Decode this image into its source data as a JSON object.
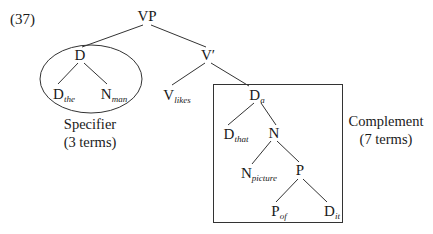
{
  "example_number": "(37)",
  "nodes": {
    "vp": {
      "label": "VP",
      "sub": ""
    },
    "d_spec": {
      "label": "D",
      "sub": ""
    },
    "d_the": {
      "label": "D",
      "sub": "the"
    },
    "n_man": {
      "label": "N",
      "sub": "man"
    },
    "v_bar": {
      "label": "V′",
      "sub": ""
    },
    "v_likes": {
      "label": "V",
      "sub": "likes"
    },
    "d_a": {
      "label": "D",
      "sub": "a"
    },
    "d_that": {
      "label": "D",
      "sub": "that"
    },
    "n": {
      "label": "N",
      "sub": ""
    },
    "n_picture": {
      "label": "N",
      "sub": "picture"
    },
    "p": {
      "label": "P",
      "sub": ""
    },
    "p_of": {
      "label": "P",
      "sub": "of"
    },
    "d_it": {
      "label": "D",
      "sub": "it"
    }
  },
  "annotations": {
    "specifier": {
      "title": "Specifier",
      "count": "(3 terms)"
    },
    "complement": {
      "title": "Complement",
      "count": "(7 terms)"
    }
  },
  "colors": {
    "ink": "#1a1a1a",
    "line": "#333333",
    "background": "#ffffff"
  }
}
